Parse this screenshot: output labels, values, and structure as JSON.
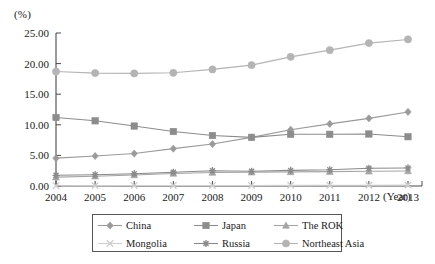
{
  "chart_data": {
    "type": "line",
    "title": "",
    "xlabel": "(Year)",
    "ylabel": "(%)",
    "x": [
      2004,
      2005,
      2006,
      2007,
      2008,
      2009,
      2010,
      2011,
      2012,
      2013
    ],
    "categories": [
      "2004",
      "2005",
      "2006",
      "2007",
      "2008",
      "2009",
      "2010",
      "2011",
      "2012",
      "2013"
    ],
    "ylim": [
      0,
      25
    ],
    "yticks": [
      0,
      5,
      10,
      15,
      20,
      25
    ],
    "ytick_labels": [
      "0.00",
      "5.00",
      "10.00",
      "15.00",
      "20.00",
      "25.00"
    ],
    "grid": false,
    "legend_position": "bottom",
    "series": [
      {
        "name": "China",
        "marker": "diamond",
        "color": "#9a9a9a",
        "values": [
          4.55,
          4.9,
          5.3,
          6.1,
          6.85,
          7.95,
          9.2,
          10.15,
          11.05,
          12.1
        ]
      },
      {
        "name": "Japan",
        "marker": "square",
        "color": "#8c8c8c",
        "values": [
          11.2,
          10.65,
          9.8,
          8.9,
          8.25,
          7.95,
          8.45,
          8.45,
          8.5,
          8.05
        ]
      },
      {
        "name": "The ROK",
        "marker": "triangle",
        "color": "#a5a5a5",
        "values": [
          1.45,
          1.6,
          1.8,
          2.05,
          2.2,
          2.25,
          2.3,
          2.35,
          2.4,
          2.45
        ]
      },
      {
        "name": "Mongolia",
        "marker": "x",
        "color": "#cfcfcf",
        "values": [
          0.05,
          0.06,
          0.07,
          0.08,
          0.09,
          0.08,
          0.1,
          0.12,
          0.13,
          0.14
        ]
      },
      {
        "name": "Russia",
        "marker": "star",
        "color": "#8a8a8a",
        "values": [
          1.75,
          1.85,
          2.0,
          2.25,
          2.5,
          2.4,
          2.55,
          2.65,
          2.9,
          2.95
        ]
      },
      {
        "name": "Northeast Asia",
        "marker": "circle",
        "color": "#b4b4b4",
        "values": [
          18.7,
          18.45,
          18.4,
          18.5,
          19.05,
          19.75,
          21.1,
          22.2,
          23.35,
          23.95
        ]
      }
    ]
  },
  "legend": {
    "entries": [
      {
        "label": "China"
      },
      {
        "label": "Japan"
      },
      {
        "label": "The ROK"
      },
      {
        "label": "Mongolia"
      },
      {
        "label": "Russia"
      },
      {
        "label": "Northeast Asia"
      }
    ]
  }
}
